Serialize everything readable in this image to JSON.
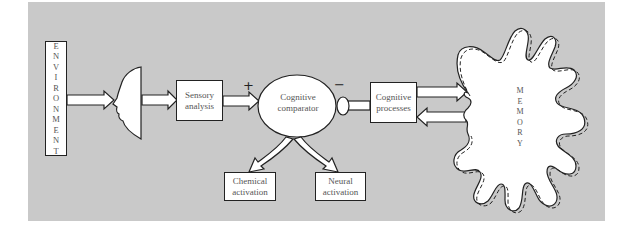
{
  "diagram": {
    "colors": {
      "panel_background": "#c9c9c9",
      "box_fill": "#ffffff",
      "stroke": "#222222",
      "text": "#555555"
    },
    "nodes": {
      "environment": {
        "label": "ENVIRONMENT",
        "letters": [
          "E",
          "N",
          "V",
          "I",
          "R",
          "O",
          "N",
          "M",
          "E",
          "N",
          "T"
        ]
      },
      "perceiver": {
        "label": "face-profile"
      },
      "sensory_analysis": {
        "line1": "Sensory",
        "line2": "analysis"
      },
      "cognitive_comparator": {
        "line1": "Cognitive",
        "line2": "comparator"
      },
      "cognitive_processes": {
        "line1": "Cognitive",
        "line2": "processes"
      },
      "chemical_activation": {
        "line1": "Chemical",
        "line2": "activation"
      },
      "neural_activation": {
        "line1": "Neural",
        "line2": "activation"
      },
      "memory": {
        "label": "MEMORY",
        "letters": [
          "M",
          "E",
          "M",
          "O",
          "R",
          "Y"
        ]
      }
    },
    "signs": {
      "positive_input": "+",
      "negative_output": "−"
    },
    "edges": [
      {
        "from": "environment",
        "to": "perceiver",
        "type": "block-arrow"
      },
      {
        "from": "perceiver",
        "to": "sensory_analysis",
        "type": "block-arrow"
      },
      {
        "from": "sensory_analysis",
        "to": "cognitive_comparator",
        "type": "block-arrow",
        "sign": "+"
      },
      {
        "from": "cognitive_comparator",
        "to": "cognitive_processes",
        "type": "inhibitory-link",
        "sign": "−"
      },
      {
        "from": "cognitive_processes",
        "to": "memory",
        "type": "block-arrow"
      },
      {
        "from": "memory",
        "to": "cognitive_processes",
        "type": "block-arrow"
      },
      {
        "from": "cognitive_comparator",
        "to": "chemical_activation",
        "type": "curved-block-arrow"
      },
      {
        "from": "cognitive_comparator",
        "to": "neural_activation",
        "type": "curved-block-arrow"
      }
    ]
  }
}
